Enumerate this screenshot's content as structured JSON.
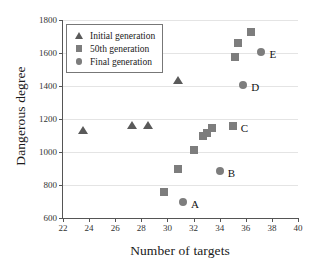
{
  "chart_data": {
    "type": "scatter",
    "title": "",
    "xlabel": "Number of targets",
    "ylabel": "Dangerous degree",
    "xlim": [
      22,
      40
    ],
    "ylim": [
      600,
      1800
    ],
    "xticks": [
      22,
      24,
      26,
      28,
      30,
      32,
      34,
      36,
      38,
      40
    ],
    "yticks": [
      600,
      800,
      1000,
      1200,
      1400,
      1600,
      1800
    ],
    "grid": true,
    "legend_position": "upper left",
    "series": [
      {
        "name": "Initial generation",
        "marker": "triangle",
        "color": "#5a5a5a",
        "points": [
          {
            "x": 23.5,
            "y": 1135
          },
          {
            "x": 27.3,
            "y": 1165
          },
          {
            "x": 28.5,
            "y": 1163
          },
          {
            "x": 30.8,
            "y": 1437
          }
        ]
      },
      {
        "name": "50th generation",
        "marker": "square",
        "color": "#7d7d7d",
        "points": [
          {
            "x": 29.7,
            "y": 757
          },
          {
            "x": 30.8,
            "y": 895
          },
          {
            "x": 32.0,
            "y": 1015
          },
          {
            "x": 32.7,
            "y": 1100
          },
          {
            "x": 33.0,
            "y": 1118
          },
          {
            "x": 33.4,
            "y": 1148
          },
          {
            "x": 35.0,
            "y": 1160,
            "label": "C"
          },
          {
            "x": 35.2,
            "y": 1573
          },
          {
            "x": 35.4,
            "y": 1658
          },
          {
            "x": 36.4,
            "y": 1725
          }
        ]
      },
      {
        "name": "Final generation",
        "marker": "circle",
        "color": "#7d7d7d",
        "points": [
          {
            "x": 31.2,
            "y": 700,
            "label": "A"
          },
          {
            "x": 34.0,
            "y": 885,
            "label": "B"
          },
          {
            "x": 35.8,
            "y": 1405,
            "label": "D"
          },
          {
            "x": 37.2,
            "y": 1605,
            "label": "E"
          }
        ]
      }
    ]
  }
}
